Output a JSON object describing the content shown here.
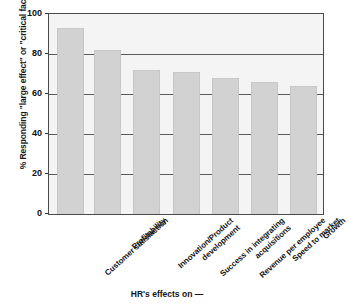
{
  "chart_data": {
    "type": "bar",
    "title": "",
    "subtitle": "",
    "xlabel": "HR's effects on —",
    "ylabel": "% Responding \"large effect\" or \"critical factor\"",
    "categories": [
      "Customer satisfaction",
      "Profitability",
      "Innovation/Product development",
      "Success in integrating acquisitions",
      "Revenue per employee",
      "Speed to market",
      "Growth"
    ],
    "values": [
      93,
      82,
      72,
      71,
      68,
      66,
      64
    ],
    "ylim": [
      0,
      100
    ],
    "yticks": [
      0,
      20,
      40,
      60,
      80,
      100
    ],
    "ytick_labels": [
      "0",
      "20",
      "40",
      "60",
      "80",
      "100"
    ],
    "gridlines": [
      20,
      40,
      60,
      80
    ],
    "grid": true,
    "legend": "none",
    "bar_color": "#d2d2d2",
    "plot_background": "#f4f4f4",
    "axis_color": "#4a4a4a",
    "gridline_color": "#5a5a5a"
  },
  "axis": {
    "y_title": "% Responding \"large effect\" or \"critical factor\"",
    "x_title": "HR's effects on —"
  },
  "categories_wrapped": [
    [
      "Customer satisfaction"
    ],
    [
      "Profitability"
    ],
    [
      "Innovation/Product",
      "development"
    ],
    [
      "Success in integrating",
      "acquisitions"
    ],
    [
      "Revenue per employee"
    ],
    [
      "Speed to market"
    ],
    [
      "Growth"
    ]
  ]
}
